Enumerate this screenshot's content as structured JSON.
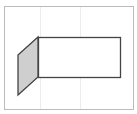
{
  "diagram": {
    "frame": {
      "x": 4,
      "y": 6,
      "width": 129,
      "height": 103,
      "stroke": "#bbbbbb"
    },
    "gridlines": {
      "xs": [
        40,
        80
      ],
      "color": "#ececec"
    },
    "rectangle": {
      "x": 38,
      "y": 37,
      "width": 82,
      "height": 40,
      "stroke": "#444444",
      "fill": "#ffffff"
    },
    "parallelogram": {
      "points": "18,55 38,37 38,77 18,95",
      "fill": "#cfcfcf",
      "stroke": "#444444"
    }
  }
}
